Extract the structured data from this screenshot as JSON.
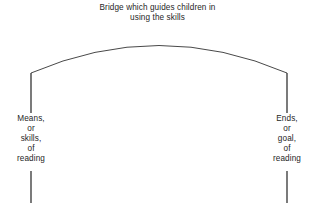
{
  "diagram": {
    "background_color": "#ffffff",
    "stroke_color": "#333333",
    "text_color": "#262626",
    "caption": {
      "line1": "Bridge which guides children in",
      "line2": "using the skills"
    },
    "left_pier": {
      "line1": "Means,",
      "line2": "or",
      "line3": "skills,",
      "line4": "of",
      "line5": "reading"
    },
    "right_pier": {
      "line1": "Ends,",
      "line2": "or",
      "line3": "goal,",
      "line4": "of",
      "line5": "reading"
    }
  }
}
